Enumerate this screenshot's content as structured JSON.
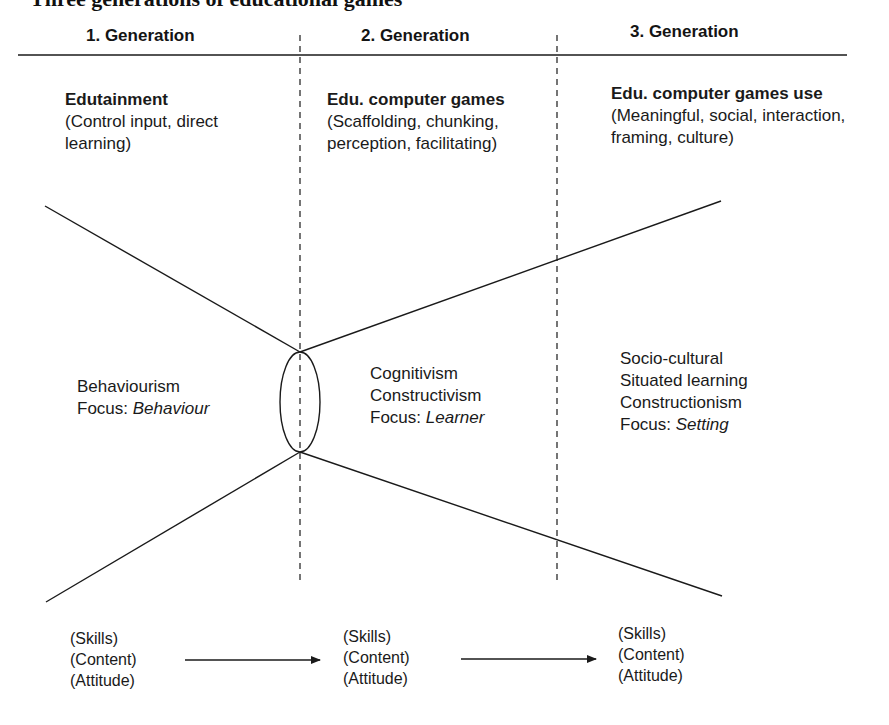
{
  "figure": {
    "cut_off_title": "Three generations of educational games"
  },
  "generations": [
    {
      "header": "1. Generation",
      "era_title": "Edutainment",
      "era_desc": "(Control input, direct learning)",
      "theory_lines": [
        "Behaviourism"
      ],
      "focus_label": "Focus:",
      "focus_value": "Behaviour",
      "outcomes": [
        "(Skills)",
        "(Content)",
        "(Attitude)"
      ]
    },
    {
      "header": "2. Generation",
      "era_title": "Edu. computer games",
      "era_desc": "(Scaffolding, chunking, perception, facilitating)",
      "theory_lines": [
        "Cognitivism",
        "Constructivism"
      ],
      "focus_label": "Focus:",
      "focus_value": "Learner",
      "outcomes": [
        "(Skills)",
        "(Content)",
        "(Attitude)"
      ]
    },
    {
      "header": "3. Generation",
      "era_title": "Edu. computer games use",
      "era_desc": "(Meaningful, social, interaction, framing, culture)",
      "theory_lines": [
        "Socio-cultural",
        "Situated learning",
        "Constructionism"
      ],
      "focus_label": "Focus:",
      "focus_value": "Setting",
      "outcomes": [
        "(Skills)",
        "(Content)",
        "(Attitude)"
      ]
    }
  ],
  "colors": {
    "ink": "#1a1a1a",
    "background": "#ffffff"
  }
}
